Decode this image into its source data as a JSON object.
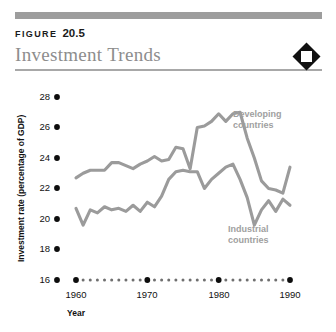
{
  "header": {
    "figure_word": "FIGURE",
    "figure_number": "20.5",
    "title": "Investment Trends",
    "badge_icon": "diamond-badge-icon",
    "rule_color": "#9d9d9d",
    "title_color": "#8d8d8d"
  },
  "chart_data": {
    "type": "line",
    "title": "Investment Trends",
    "xlabel": "Year",
    "ylabel": "Investment rate (percentage of GDP)",
    "xlim": [
      1960,
      1990
    ],
    "ylim": [
      16,
      28
    ],
    "ytick_labels": [
      "28",
      "26",
      "24",
      "22",
      "20",
      "18",
      "16"
    ],
    "yticks": [
      28,
      26,
      24,
      22,
      20,
      18,
      16
    ],
    "xtick_labels": [
      "1960",
      "1970",
      "1980",
      "1990"
    ],
    "xticks": [
      1960,
      1970,
      1980,
      1990
    ],
    "xminor_step": 1,
    "grid": false,
    "legend": "inline-annotations",
    "line_color": "#9b9b9b",
    "x": [
      1960,
      1961,
      1962,
      1963,
      1964,
      1965,
      1966,
      1967,
      1968,
      1969,
      1970,
      1971,
      1972,
      1973,
      1974,
      1975,
      1976,
      1977,
      1978,
      1979,
      1980,
      1981,
      1982,
      1983,
      1984,
      1985,
      1986,
      1987,
      1988,
      1989,
      1990
    ],
    "series": [
      {
        "name": "Developing countries",
        "label": "Developing\ncountries",
        "label_line1": "Developing",
        "label_line2": "countries",
        "values": [
          22.7,
          23.0,
          23.2,
          23.2,
          23.2,
          23.7,
          23.7,
          23.5,
          23.3,
          23.6,
          23.8,
          24.1,
          23.8,
          23.9,
          24.7,
          24.6,
          23.3,
          26.0,
          26.1,
          26.4,
          26.9,
          26.4,
          26.9,
          27.0,
          25.3,
          24.0,
          22.5,
          22.0,
          21.9,
          21.7,
          23.4
        ]
      },
      {
        "name": "Industrial countries",
        "label": "Industrial\ncountries",
        "label_line1": "Industrial",
        "label_line2": "countries",
        "values": [
          20.7,
          19.6,
          20.6,
          20.4,
          20.8,
          20.6,
          20.7,
          20.5,
          20.9,
          20.5,
          21.1,
          20.8,
          21.5,
          22.6,
          23.1,
          23.2,
          23.1,
          23.1,
          22.0,
          22.6,
          23.0,
          23.4,
          23.6,
          22.6,
          21.4,
          19.6,
          20.6,
          21.2,
          20.5,
          21.3,
          20.9
        ]
      }
    ],
    "annotations": [
      {
        "text": "Developing countries",
        "series": "Developing countries"
      },
      {
        "text": "Industrial countries",
        "series": "Industrial countries"
      }
    ]
  }
}
